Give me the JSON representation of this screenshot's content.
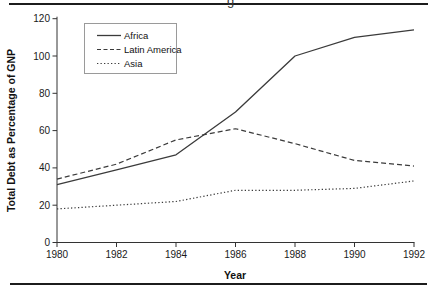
{
  "page": {
    "cropped_text_remnant": "g"
  },
  "chart_data": {
    "type": "line",
    "title": "",
    "xlabel": "Year",
    "ylabel": "Total Debt as Percentage of GNP",
    "x": [
      1980,
      1982,
      1984,
      1986,
      1988,
      1990,
      1992
    ],
    "xlim": [
      1980,
      1992
    ],
    "ylim": [
      0,
      120
    ],
    "xticks": [
      1980,
      1982,
      1984,
      1986,
      1988,
      1990,
      1992
    ],
    "yticks": [
      0,
      20,
      40,
      60,
      80,
      100,
      120
    ],
    "grid": false,
    "legend_position": "top-left-inside",
    "line_color": "#3b3b3b",
    "series": [
      {
        "name": "Africa",
        "style": "solid",
        "values": [
          31,
          39,
          47,
          70,
          100,
          110,
          114
        ]
      },
      {
        "name": "Latin America",
        "style": "dashed",
        "values": [
          34,
          42,
          55,
          61,
          53,
          44,
          41
        ]
      },
      {
        "name": "Asia",
        "style": "dotted",
        "values": [
          18,
          20,
          22,
          28,
          28,
          29,
          33
        ]
      }
    ]
  }
}
